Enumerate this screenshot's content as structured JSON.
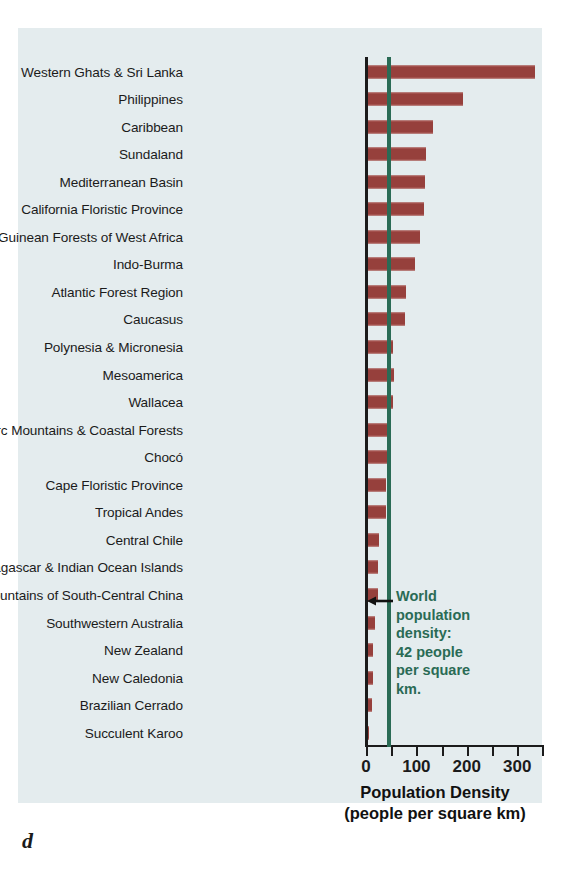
{
  "figure": {
    "panel_label": "d",
    "background_color": "#e4ecee",
    "bar_color": "#96403c",
    "accent_color": "#2a6b55"
  },
  "annotation": {
    "line1": "World",
    "line2": "population",
    "line3": "density:",
    "line4": "42 people",
    "line5": "per square",
    "line6": "km.",
    "text": "World population density: 42 people per square km."
  },
  "chart_data": {
    "type": "bar",
    "orientation": "horizontal",
    "title": "",
    "xlabel": "Population Density (people per square km)",
    "xlabel_line1": "Population Density",
    "xlabel_line2": "(people per square km)",
    "ylabel": "",
    "xlim": [
      0,
      355
    ],
    "xticks": [
      0,
      50,
      100,
      150,
      200,
      250,
      300,
      350
    ],
    "xtick_labels": [
      "0",
      "",
      "100",
      "",
      "200",
      "",
      "300",
      ""
    ],
    "labeled_ticks": [
      {
        "value": 0,
        "label": "0"
      },
      {
        "value": 100,
        "label": "100"
      },
      {
        "value": 200,
        "label": "200"
      },
      {
        "value": 300,
        "label": "300"
      }
    ],
    "grid": false,
    "legend": false,
    "reference_line": {
      "value": 42,
      "label": "World population density: 42 people per square km.",
      "color": "#2a6b55"
    },
    "categories": [
      "Western Ghats & Sri Lanka",
      "Philippines",
      "Caribbean",
      "Sundaland",
      "Mediterranean Basin",
      "California Floristic Province",
      "Guinean Forests of West Africa",
      "Indo-Burma",
      "Atlantic Forest Region",
      "Caucasus",
      "Polynesia & Micronesia",
      "Mesoamerica",
      "Wallacea",
      "Eastern Arc Mountains & Coastal Forests",
      "Chocó",
      "Cape Floristic Province",
      "Tropical Andes",
      "Central Chile",
      "Madagascar & Indian Ocean Islands",
      "Mountains of South-Central China",
      "Southwestern Australia",
      "New Zealand",
      "New Caledonia",
      "Brazilian Cerrado",
      "Succulent Karoo"
    ],
    "values": [
      336,
      192,
      132,
      119,
      117,
      115,
      107,
      97,
      79,
      77,
      54,
      56,
      54,
      44,
      42,
      40,
      40,
      26,
      24,
      23,
      17,
      14,
      13,
      12,
      5
    ]
  }
}
